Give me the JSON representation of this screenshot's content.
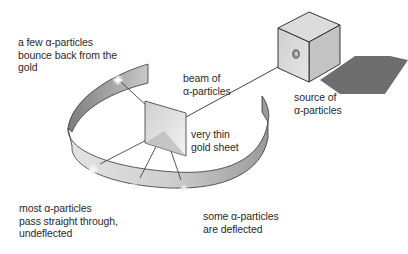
{
  "diagram": {
    "labels": {
      "bounce_back": {
        "lines": [
          "a few α-particles",
          "bounce back from the",
          "gold"
        ]
      },
      "beam": {
        "lines": [
          "beam of",
          "α-particles"
        ]
      },
      "source": {
        "lines": [
          "source of",
          "α-particles"
        ]
      },
      "gold_sheet": {
        "lines": [
          "very thin",
          "gold sheet"
        ]
      },
      "straight_through": {
        "lines": [
          "most α-particles",
          "pass straight through,",
          "undeflected"
        ]
      },
      "deflected": {
        "lines": [
          "some α-particles",
          "are deflected"
        ]
      }
    },
    "components": [
      "source-box",
      "alpha-beam",
      "gold-foil",
      "detector-screen-ring",
      "scintillation-flashes"
    ],
    "colors": {
      "ring_inner": "#8a8a8a",
      "ring_outer_light": "#d8d8d8",
      "box_face": "#d0d0d0",
      "box_shadow": "#6e6e6e",
      "line": "#444444",
      "text": "#2a2a2a"
    }
  }
}
